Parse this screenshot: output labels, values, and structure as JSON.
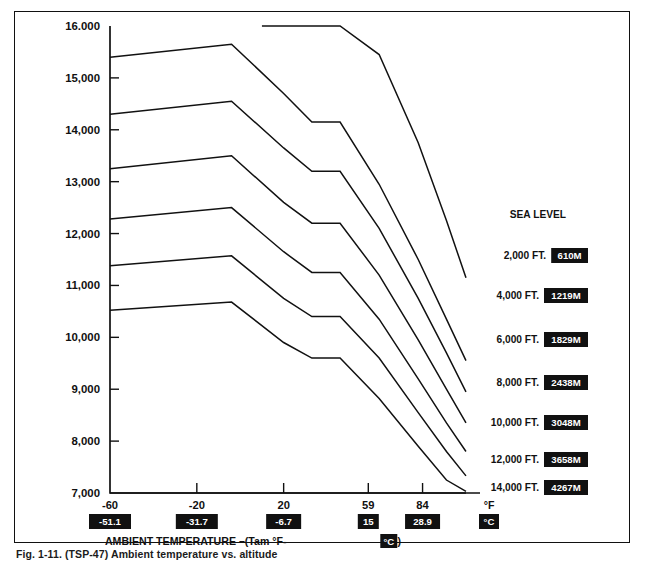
{
  "figure": {
    "caption": "Fig. 1-11.   (TSP-47) Ambient temperature vs. altitude",
    "frame_color": "#111111",
    "line_color": "#111111",
    "background": "#ffffff"
  },
  "chart_data": {
    "type": "line",
    "title": "",
    "xlabel": "AMBIENT TEMPERATURE –(Tam °F- °C )",
    "ylabel": "",
    "xlim": [
      -60,
      110
    ],
    "ylim": [
      7000,
      16000
    ],
    "grid": false,
    "legend_position": "right-inline",
    "x_unit_primary": "°F",
    "x_unit_secondary": "°C",
    "xticks_f": [
      "-60",
      "-20",
      "20",
      "59",
      "84"
    ],
    "xticks_c": [
      "-51.1",
      "-31.7",
      "-6.7",
      "15",
      "28.9"
    ],
    "xtick_positions": [
      -60,
      -20,
      20,
      59,
      84
    ],
    "yticks": [
      "16.000",
      "15,000",
      "14,000",
      "13,000",
      "12,000",
      "11,000",
      "10,000",
      "9,000",
      "8,000",
      "7,000"
    ],
    "ytick_values": [
      16000,
      15000,
      14000,
      13000,
      12000,
      11000,
      10000,
      9000,
      8000,
      7000
    ],
    "series": [
      {
        "name": "SEA LEVEL",
        "label": "SEA LEVEL",
        "altitude_ft": "",
        "altitude_m": "",
        "points": [
          [
            10,
            16000
          ],
          [
            46,
            16000
          ],
          [
            64,
            15450
          ],
          [
            82,
            13750
          ],
          [
            95,
            12250
          ],
          [
            104,
            11150
          ]
        ]
      },
      {
        "name": "2,000 FT.",
        "label": "2,000 FT.",
        "altitude_ft": "2,000 FT.",
        "altitude_m": "610M",
        "points": [
          [
            -60,
            15400
          ],
          [
            -4,
            15650
          ],
          [
            20,
            14700
          ],
          [
            33,
            14150
          ],
          [
            46,
            14150
          ],
          [
            64,
            12950
          ],
          [
            82,
            11500
          ],
          [
            95,
            10350
          ],
          [
            104,
            9550
          ]
        ]
      },
      {
        "name": "4,000 FT.",
        "label": "4,000 FT.",
        "altitude_ft": "4,000 FT.",
        "altitude_m": "1219M",
        "points": [
          [
            -60,
            14300
          ],
          [
            -4,
            14550
          ],
          [
            20,
            13650
          ],
          [
            33,
            13200
          ],
          [
            46,
            13200
          ],
          [
            64,
            12100
          ],
          [
            82,
            10750
          ],
          [
            95,
            9700
          ],
          [
            104,
            8950
          ]
        ]
      },
      {
        "name": "6,000 FT.",
        "label": "6,000 FT.",
        "altitude_ft": "6,000 FT.",
        "altitude_m": "1829M",
        "points": [
          [
            -60,
            13250
          ],
          [
            -4,
            13500
          ],
          [
            20,
            12600
          ],
          [
            33,
            12200
          ],
          [
            46,
            12200
          ],
          [
            64,
            11200
          ],
          [
            82,
            9950
          ],
          [
            95,
            9000
          ],
          [
            104,
            8350
          ]
        ]
      },
      {
        "name": "8,000 FT.",
        "label": "8,000 FT.",
        "altitude_ft": "8,000 FT.",
        "altitude_m": "2438M",
        "points": [
          [
            -60,
            12280
          ],
          [
            -4,
            12500
          ],
          [
            20,
            11650
          ],
          [
            33,
            11250
          ],
          [
            46,
            11250
          ],
          [
            64,
            10350
          ],
          [
            82,
            9200
          ],
          [
            95,
            8350
          ],
          [
            104,
            7800
          ]
        ]
      },
      {
        "name": "10,000 FT.",
        "label": "10,000 FT.",
        "altitude_ft": "10,000 FT.",
        "altitude_m": "3048M",
        "points": [
          [
            -60,
            11380
          ],
          [
            -4,
            11570
          ],
          [
            20,
            10750
          ],
          [
            33,
            10400
          ],
          [
            46,
            10400
          ],
          [
            64,
            9600
          ],
          [
            82,
            8550
          ],
          [
            95,
            7800
          ],
          [
            104,
            7330
          ]
        ]
      },
      {
        "name": "12,000 FT.",
        "label": "12,000 FT.",
        "altitude_ft": "12,000 FT.",
        "altitude_m": "3658M",
        "points": [
          [
            -60,
            10520
          ],
          [
            -4,
            10680
          ],
          [
            20,
            9900
          ],
          [
            33,
            9600
          ],
          [
            46,
            9600
          ],
          [
            64,
            8820
          ],
          [
            82,
            7900
          ],
          [
            95,
            7250
          ],
          [
            104,
            7030
          ]
        ]
      },
      {
        "name": "14,000 FT.",
        "label": "14,000 FT.",
        "altitude_ft": "14,000 FT.",
        "altitude_m": "4267M",
        "points": [
          [
            -60,
            7000
          ],
          [
            104,
            7000
          ]
        ]
      }
    ],
    "annotations": [
      {
        "text": "SEA LEVEL",
        "boxed": ""
      },
      {
        "text": "2,000 FT.",
        "boxed": "610M"
      },
      {
        "text": "4,000 FT.",
        "boxed": "1219M"
      },
      {
        "text": "6,000 FT.",
        "boxed": "1829M"
      },
      {
        "text": "8,000 FT.",
        "boxed": "2438M"
      },
      {
        "text": "10,000 FT.",
        "boxed": "3048M"
      },
      {
        "text": "12,000 FT.",
        "boxed": "3658M"
      },
      {
        "text": "14,000 FT.",
        "boxed": "4267M"
      }
    ]
  },
  "labels": {
    "axis_title_prefix": "AMBIENT TEMPERATURE –(Tam °F-",
    "axis_title_boxed": "°C",
    "axis_title_suffix": ")",
    "unit_f": "°F",
    "unit_c": "°C"
  }
}
